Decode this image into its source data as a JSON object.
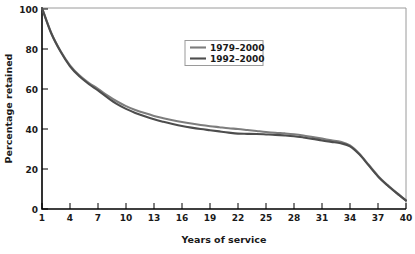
{
  "chart_data": {
    "type": "line",
    "title": "",
    "xlabel": "Years of service",
    "ylabel": "Percentage retained",
    "xlim": [
      1,
      40
    ],
    "ylim": [
      0,
      100
    ],
    "grid": false,
    "legend_position": "upper-center-right",
    "xticks": [
      1,
      4,
      7,
      10,
      13,
      16,
      19,
      22,
      25,
      28,
      31,
      34,
      37,
      40
    ],
    "xtick_labels": [
      "1",
      "4",
      "7",
      "10",
      "13",
      "16",
      "19",
      "22",
      "25",
      "28",
      "31",
      "34",
      "37",
      "40"
    ],
    "yticks": [
      0,
      20,
      40,
      60,
      80,
      100
    ],
    "ytick_labels": [
      "0",
      "20",
      "40",
      "60",
      "80",
      "100"
    ],
    "x": [
      1,
      2,
      3,
      4,
      5,
      6,
      7,
      8,
      9,
      10,
      11,
      12,
      13,
      14,
      15,
      16,
      17,
      18,
      19,
      20,
      21,
      22,
      23,
      24,
      25,
      26,
      27,
      28,
      29,
      30,
      31,
      32,
      33,
      34,
      35,
      36,
      37,
      38,
      39,
      40
    ],
    "series": [
      {
        "name": "1979–2000",
        "color": "#7d7d7d",
        "width": 2.1,
        "values": [
          100,
          87.5,
          78.5,
          71.5,
          66.5,
          62.8,
          59.8,
          56.5,
          53.6,
          51.2,
          49.3,
          47.7,
          46.3,
          45.2,
          44.2,
          43.3,
          42.5,
          41.8,
          41.2,
          40.7,
          40.2,
          39.8,
          39.3,
          38.8,
          38.3,
          37.9,
          37.6,
          37.2,
          36.6,
          35.8,
          35.0,
          34.2,
          33.4,
          31.6,
          27.5,
          22.0,
          16.5,
          12.0,
          8.0,
          4.3
        ]
      },
      {
        "name": "1992–2000",
        "color": "#4d4d4d",
        "width": 2.1,
        "values": [
          100,
          87.3,
          78.2,
          71.0,
          66.0,
          62.2,
          59.0,
          55.5,
          52.3,
          49.8,
          47.8,
          46.1,
          44.6,
          43.4,
          42.3,
          41.3,
          40.5,
          39.8,
          39.2,
          38.6,
          38.0,
          37.5,
          37.4,
          37.3,
          37.1,
          36.9,
          36.6,
          36.2,
          35.6,
          34.9,
          34.1,
          33.4,
          32.7,
          31.2,
          27.2,
          21.7,
          16.2,
          11.8,
          7.9,
          4.2
        ]
      }
    ]
  },
  "legend": {
    "entries": [
      {
        "label": "1979–2000"
      },
      {
        "label": "1992–2000"
      }
    ]
  },
  "axes": {
    "x_title": "Years of service",
    "y_title": "Percentage retained"
  }
}
